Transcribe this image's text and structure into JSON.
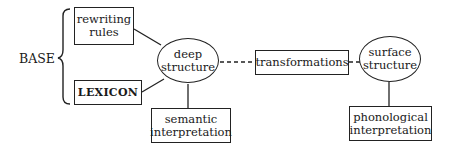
{
  "diagram": {
    "type": "generative-grammar-model",
    "base_label": "BASE",
    "nodes": {
      "rewriting_rules": {
        "line1": "rewriting",
        "line2": "rules",
        "shape": "box"
      },
      "lexicon": {
        "line1": "LEXICON",
        "shape": "box"
      },
      "deep_structure": {
        "line1": "deep",
        "line2": "structure",
        "shape": "ellipse"
      },
      "semantic_interpretation": {
        "line1": "semantic",
        "line2": "interpretation",
        "shape": "box"
      },
      "transformations": {
        "line1": "transformations",
        "shape": "box"
      },
      "surface_structure": {
        "line1": "surface",
        "line2": "structure",
        "shape": "ellipse"
      },
      "phonological_interpretation": {
        "line1": "phonological",
        "line2": "interpretation",
        "shape": "box"
      }
    },
    "edges": [
      {
        "from": "rewriting rules",
        "to": "deep structure",
        "style": "solid"
      },
      {
        "from": "LEXICON",
        "to": "deep structure",
        "style": "solid"
      },
      {
        "from": "deep structure",
        "to": "semantic interpretation",
        "style": "solid"
      },
      {
        "from": "deep structure",
        "to": "transformations",
        "style": "dashed"
      },
      {
        "from": "transformations",
        "to": "surface structure",
        "style": "dashed"
      },
      {
        "from": "surface structure",
        "to": "phonological interpretation",
        "style": "solid"
      }
    ]
  }
}
